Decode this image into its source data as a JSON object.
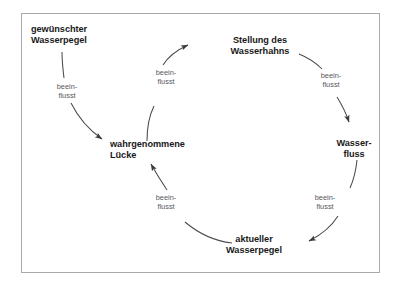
{
  "diagram": {
    "type": "causal-loop-diagram",
    "language": "de",
    "background_color": "#ffffff",
    "frame_border_color": "#a9a9ad",
    "node_text_color": "#1a1a1a",
    "edge_label_color": "#58585c",
    "arrow_color": "#4a4a4e",
    "nodes": [
      {
        "id": "gewuenschter-wasserpegel",
        "lines": [
          "gewünschter",
          "Wasserpegel"
        ],
        "align": "left",
        "x": 31,
        "y": 24
      },
      {
        "id": "stellung-des-wasserhahns",
        "lines": [
          "Stellung des",
          "Wasserhahns"
        ],
        "align": "center",
        "x": 218,
        "y": 35
      },
      {
        "id": "wasserfluss",
        "lines": [
          "Wasser-",
          "fluss"
        ],
        "align": "center",
        "x": 348,
        "y": 138
      },
      {
        "id": "aktueller-wasserpegel",
        "lines": [
          "aktueller",
          "Wasserpegel"
        ],
        "align": "center",
        "x": 252,
        "y": 234
      },
      {
        "id": "wahrgenommene-luecke",
        "lines": [
          "wahrgenommene",
          "Lücke"
        ],
        "align": "left",
        "x": 110,
        "y": 139
      }
    ],
    "edges": [
      {
        "id": "luecke-to-stellung",
        "from": "wahrgenommene-luecke",
        "to": "stellung-des-wasserhahns",
        "label_lines": [
          "beein-",
          "flusst"
        ],
        "label_x": 168,
        "label_y": 72
      },
      {
        "id": "stellung-to-wasserfluss",
        "from": "stellung-des-wasserhahns",
        "to": "wasserfluss",
        "label_lines": [
          "beein-",
          "flusst"
        ],
        "label_x": 331,
        "label_y": 75
      },
      {
        "id": "wasserfluss-to-aktueller",
        "from": "wasserfluss",
        "to": "aktueller-wasserpegel",
        "label_lines": [
          "beein-",
          "flusst"
        ],
        "label_x": 325,
        "label_y": 197
      },
      {
        "id": "aktueller-to-luecke",
        "from": "aktueller-wasserpegel",
        "to": "wahrgenommene-luecke",
        "label_lines": [
          "beein-",
          "flusst"
        ],
        "label_x": 166,
        "label_y": 197
      },
      {
        "id": "gewuenschter-to-luecke",
        "from": "gewuenschter-wasserpegel",
        "to": "wahrgenommene-luecke",
        "label_lines": [
          "beein-",
          "flusst"
        ],
        "label_x": 67,
        "label_y": 86
      }
    ]
  }
}
